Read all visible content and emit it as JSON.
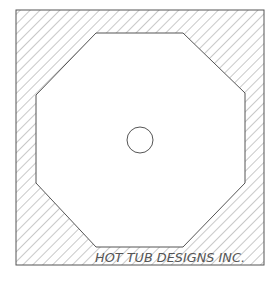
{
  "diagram": {
    "type": "cad-plan",
    "label": "HOT TUB DESIGNS INC.",
    "colors": {
      "line": "#555555",
      "hatch": "#777777",
      "background": "#ffffff"
    },
    "outer_square": {
      "x": 16,
      "y": 10,
      "width": 248,
      "height": 255
    },
    "octagon_points": "96,33 183,33 245,93 245,183 183,247 96,247 36,183 36,95",
    "drain": {
      "cx": 140,
      "cy": 140,
      "r": 13
    }
  }
}
